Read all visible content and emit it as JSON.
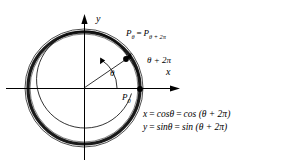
{
  "figure": {
    "background_color": "#ffffff",
    "stroke_color": "#000000",
    "axes": {
      "x_label": "x",
      "y_label": "y",
      "origin_x": 84,
      "origin_y": 88
    },
    "circle": {
      "radius": 56,
      "outer_radius": 59,
      "thick_stroke": 3.2,
      "thin_stroke": 0.7
    },
    "points": [
      {
        "name": "P-theta",
        "label_base": "P",
        "label_sub": "θ",
        "x": 126,
        "y": 59
      },
      {
        "name": "P-zero",
        "label_base": "P",
        "label_sub": "0",
        "x": 140,
        "y": 89
      }
    ],
    "labels": {
      "p_equality_lhs": "P",
      "p_equality_lhs_sub": "θ",
      "p_equality_eq": "=",
      "p_equality_rhs": "P",
      "p_equality_rhs_sub": "θ + 2π",
      "angle_theta": "θ",
      "angle_theta_plus": "θ + 2π",
      "p_zero_base": "P",
      "p_zero_sub": "0"
    },
    "equations": {
      "x_equation": "x = cosθ = cos (θ + 2π)",
      "y_equation": "y = sinθ = sin (θ + 2π)",
      "x_lhs": "x",
      "x_eq1": "=",
      "x_mid": "cosθ",
      "x_eq2": "=",
      "x_rhs": "cos (θ + 2π)",
      "y_lhs": "y",
      "y_eq1": "=",
      "y_mid": "sinθ",
      "y_eq2": "=",
      "y_rhs": "sin (θ + 2π)"
    }
  }
}
